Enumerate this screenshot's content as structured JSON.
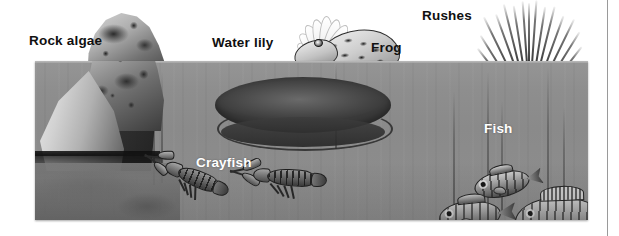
{
  "figure": {
    "background_color": "#ffffff",
    "water_color": "#8b8b8b",
    "label_dark_color": "#101010",
    "label_light_color": "#ffffff"
  },
  "labels": [
    {
      "id": "rock-algae",
      "text": "Rock algae",
      "style": "dark"
    },
    {
      "id": "water-lily",
      "text": "Water lily",
      "style": "dark"
    },
    {
      "id": "frog",
      "text": "Frog",
      "style": "dark"
    },
    {
      "id": "rushes",
      "text": "Rushes",
      "style": "dark"
    },
    {
      "id": "crayfish",
      "text": "Crayfish",
      "style": "light"
    },
    {
      "id": "fish",
      "text": "Fish",
      "style": "light"
    }
  ],
  "organisms": {
    "rock_algae": {
      "label": "Rock algae",
      "count": 2
    },
    "water_lily": {
      "label": "Water lily",
      "count": 1
    },
    "frog": {
      "label": "Frog",
      "count": 1
    },
    "rushes": {
      "label": "Rushes",
      "count": 1
    },
    "crayfish": {
      "label": "Crayfish",
      "count": 2
    },
    "fish": {
      "label": "Fish",
      "count": 3
    }
  }
}
